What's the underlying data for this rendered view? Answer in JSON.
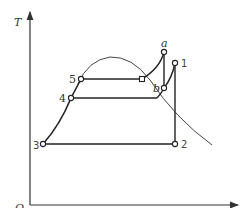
{
  "diagram": {
    "type": "T-s diagram",
    "axes": {
      "y_label": "T",
      "x_label": "s",
      "origin_label": "O"
    },
    "points": [
      {
        "id": "1",
        "label": "1"
      },
      {
        "id": "2",
        "label": "2"
      },
      {
        "id": "3",
        "label": "3"
      },
      {
        "id": "4",
        "label": "4"
      },
      {
        "id": "5",
        "label": "5"
      },
      {
        "id": "a",
        "label": "a"
      },
      {
        "id": "b",
        "label": "b"
      }
    ],
    "curves": [
      {
        "name": "saturation-dome",
        "description": "saturation curve"
      },
      {
        "name": "process-3-4-5",
        "description": "liquid heating"
      },
      {
        "name": "process-5-sat",
        "description": "evaporation at high pressure"
      },
      {
        "name": "process-4-b",
        "description": "evaporation at lower pressure"
      },
      {
        "name": "process-sat-a",
        "description": "superheat to a"
      },
      {
        "name": "process-a-b",
        "description": "a to b"
      },
      {
        "name": "process-b-1",
        "description": "b to 1"
      },
      {
        "name": "process-1-2",
        "description": "isentropic expansion"
      },
      {
        "name": "process-2-3",
        "description": "condensation"
      }
    ]
  }
}
